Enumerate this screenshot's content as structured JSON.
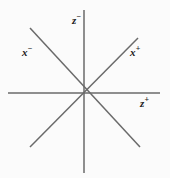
{
  "diagram": {
    "canvas": {
      "width": 170,
      "height": 178,
      "background_color": "#fbfbfb"
    },
    "origin": {
      "x": 84,
      "y": 93
    },
    "line_color": "#6a6a6a",
    "label_color": "#1a1a1a",
    "axes": [
      {
        "name": "horizontal-z-axis",
        "x1": 8,
        "y1": 93,
        "x2": 160,
        "y2": 93
      },
      {
        "name": "vertical-z-axis",
        "x1": 84,
        "y1": 10,
        "x2": 84,
        "y2": 173
      },
      {
        "name": "diagonal-x-plus-axis",
        "x1": 30,
        "y1": 147,
        "x2": 138,
        "y2": 38
      },
      {
        "name": "diagonal-x-minus-axis",
        "x1": 30,
        "y1": 28,
        "x2": 140,
        "y2": 147
      }
    ],
    "labels": {
      "z_minus": {
        "base": "z",
        "sign": "−"
      },
      "z_plus": {
        "base": "z",
        "sign": "+"
      },
      "x_minus": {
        "base": "x",
        "sign": "−"
      },
      "x_plus": {
        "base": "x",
        "sign": "+"
      }
    }
  }
}
